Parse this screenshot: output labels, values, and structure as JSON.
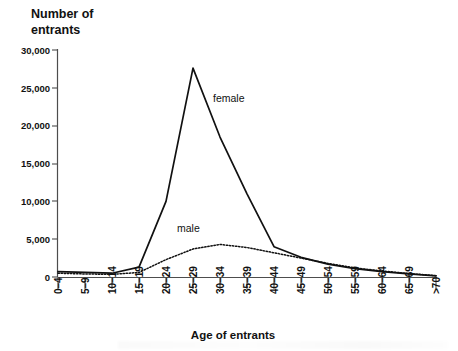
{
  "chart_data": {
    "type": "line",
    "title": "",
    "ylabel": "Number of\nentrants",
    "ylabel_line1": "Number of",
    "ylabel_line2": "entrants",
    "xlabel": "Age of entrants",
    "categories": [
      "0–4",
      "5–9",
      "10–14",
      "15–19",
      "20–24",
      "25–29",
      "30–34",
      "35–39",
      "40–44",
      "45–49",
      "50–54",
      "55–59",
      "60–64",
      "65–69",
      ">70"
    ],
    "ylim": [
      0,
      30000
    ],
    "yticks": [
      0,
      5000,
      10000,
      15000,
      20000,
      25000,
      30000
    ],
    "ytick_labels": [
      "0",
      "5,000",
      "10,000",
      "15,000",
      "20,000",
      "25,000",
      "30,000"
    ],
    "grid": false,
    "legend_position": "inline-annotations",
    "series": [
      {
        "name": "female",
        "style": "solid",
        "values": [
          700,
          600,
          500,
          1300,
          10000,
          27600,
          18500,
          11000,
          4000,
          2600,
          1700,
          1100,
          700,
          400,
          150
        ]
      },
      {
        "name": "male",
        "style": "dotted",
        "values": [
          500,
          400,
          350,
          600,
          2300,
          3700,
          4300,
          3900,
          3200,
          2500,
          1800,
          1200,
          800,
          450,
          180
        ]
      }
    ],
    "annotations": [
      {
        "text": "female",
        "series": "female"
      },
      {
        "text": "male",
        "series": "male"
      }
    ]
  }
}
